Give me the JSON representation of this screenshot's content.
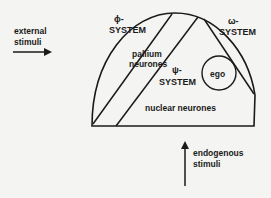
{
  "diagram": {
    "title": "",
    "labels": {
      "external_stimuli_1": "external",
      "external_stimuli_2": "stimuli",
      "phi_symbol": "ϕ-",
      "phi_system": "SYSTEM",
      "omega_symbol": "ω-",
      "omega_system": "SYSTEM",
      "psi_symbol": "ψ-",
      "psi_system": "SYSTEM",
      "pallium_1": "pallium",
      "pallium_2": "neurones",
      "ego": "ego",
      "nuclear": "nuclear neurones",
      "endogenous_1": "endogenous",
      "endogenous_2": "stimuli"
    },
    "colors": {
      "ink": "#1a1a1a",
      "background": "#f4f4f2"
    }
  }
}
